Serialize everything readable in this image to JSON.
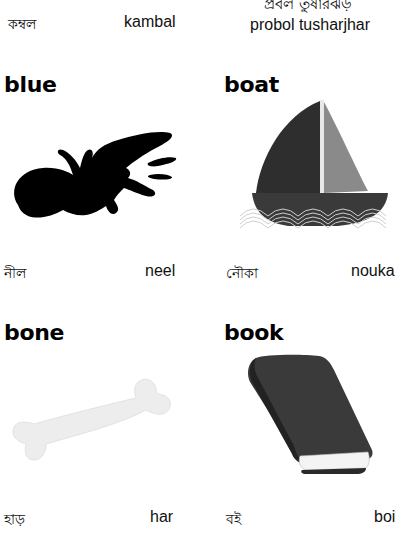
{
  "top_row": {
    "left": {
      "bengali": "কম্বল",
      "translit": "kambal"
    },
    "right": {
      "bengali": "প্রবল তুষারঝড়",
      "translit": "probol tusharjhar"
    }
  },
  "cards": [
    {
      "word": "blue",
      "bengali": "নীল",
      "translit": "neel",
      "image": "ink-splat"
    },
    {
      "word": "boat",
      "bengali": "নৌকা",
      "translit": "nouka",
      "image": "sailboat"
    },
    {
      "word": "bone",
      "bengali": "হাড়",
      "translit": "har",
      "image": "bone"
    },
    {
      "word": "book",
      "bengali": "বই",
      "translit": "boi",
      "image": "book"
    }
  ]
}
